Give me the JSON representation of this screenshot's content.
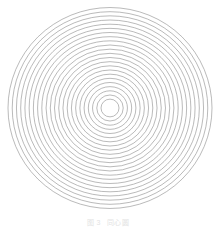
{
  "figure": {
    "kind": "concentric-circles-diagram",
    "background_color": "#ffffff",
    "stroke_color": "#8c8c8c",
    "stroke_width": 0.6,
    "fill": "none",
    "caption": {
      "visible": true,
      "legible": false,
      "text": "图 3  同心圆",
      "label": "图 3",
      "title": "同心圆",
      "color": "#e3e3e3",
      "font_size_px": 7
    }
  },
  "chart_data": {
    "type": "scatter",
    "title": "",
    "subtitle": "",
    "xlabel": "",
    "ylabel": "",
    "grid": false,
    "legend": null,
    "annotations": [],
    "geometry": {
      "shape": "concentric-circles",
      "center_x": 110,
      "center_y": 108,
      "ring_count": 23,
      "inner_radius": 9,
      "outer_radius": 102,
      "radius_step": 4.227,
      "units": "px",
      "aspect_ratio_x": 1.0,
      "aspect_ratio_y": 0.985
    },
    "radii": [
      9.0,
      13.23,
      17.45,
      21.68,
      25.91,
      30.14,
      34.36,
      38.59,
      42.82,
      47.05,
      51.27,
      55.5,
      59.73,
      63.95,
      68.18,
      72.41,
      76.64,
      80.86,
      85.09,
      89.32,
      93.55,
      97.77,
      102.0
    ],
    "ring_indices": [
      1,
      2,
      3,
      4,
      5,
      6,
      7,
      8,
      9,
      10,
      11,
      12,
      13,
      14,
      15,
      16,
      17,
      18,
      19,
      20,
      21,
      22,
      23
    ],
    "xlim": [
      8,
      212
    ],
    "ylim": [
      6,
      210
    ]
  }
}
